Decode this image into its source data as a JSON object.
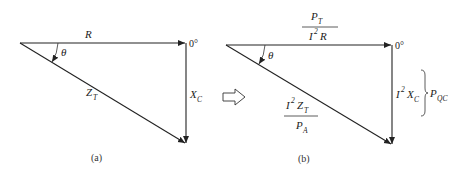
{
  "diagram": {
    "panel_a": {
      "caption": "(a)",
      "horizontal_label": "R",
      "vertical_label_main": "X",
      "vertical_label_sub": "C",
      "hypotenuse_label_main": "Z",
      "hypotenuse_label_sub": "T",
      "angle_label": "θ",
      "reference_angle": "0°"
    },
    "transform_arrow": "hollow-right-arrow",
    "panel_b": {
      "caption": "(b)",
      "horizontal_top_main": "P",
      "horizontal_top_sub": "T",
      "horizontal_bottom_i": "I",
      "horizontal_bottom_sup": "2",
      "horizontal_bottom_main": "R",
      "vertical_i": "I",
      "vertical_sup": "2",
      "vertical_main": "X",
      "vertical_sub": "C",
      "vertical_brace_main": "P",
      "vertical_brace_sub": "QC",
      "hypotenuse_top_i": "I",
      "hypotenuse_top_sup": "2",
      "hypotenuse_top_main": "Z",
      "hypotenuse_top_sub": "T",
      "hypotenuse_bottom_main": "P",
      "hypotenuse_bottom_sub": "A",
      "angle_label": "θ",
      "reference_angle": "0°"
    }
  }
}
